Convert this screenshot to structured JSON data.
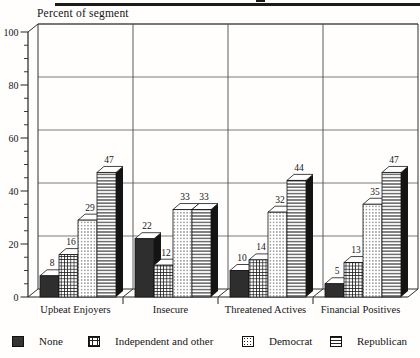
{
  "chart_data": {
    "type": "bar",
    "style": "3d-grouped",
    "title": "",
    "ylabel": "Percent of segment",
    "xlabel": "",
    "categories": [
      "Upbeat Enjoyers",
      "Insecure",
      "Threatened Actives",
      "Financial Positives"
    ],
    "series": [
      {
        "name": "None",
        "pattern": "solid-dark",
        "values": [
          8,
          22,
          10,
          5
        ]
      },
      {
        "name": "Independent and other",
        "pattern": "grid",
        "values": [
          16,
          12,
          14,
          13
        ]
      },
      {
        "name": "Democrat",
        "pattern": "dots",
        "values": [
          29,
          33,
          32,
          35
        ]
      },
      {
        "name": "Republican",
        "pattern": "hlines",
        "values": [
          47,
          33,
          44,
          47
        ]
      }
    ],
    "ylim": [
      0,
      100
    ],
    "yticks": [
      0,
      20,
      40,
      60,
      80,
      100
    ],
    "minor_tick_step": 5,
    "grid": true,
    "value_labels": true,
    "legend_position": "bottom",
    "colors": {
      "ink": "#1b1b1b",
      "grid_line": "#5a5a5a",
      "bar_side": "#141414",
      "bar_top": "#ffffff",
      "none_fill": "#2e2e2e"
    }
  },
  "legend": {
    "items": [
      {
        "label": "None",
        "pattern": "solid-dark"
      },
      {
        "label": "Independent and other",
        "pattern": "grid"
      },
      {
        "label": "Democrat",
        "pattern": "dots"
      },
      {
        "label": "Republican",
        "pattern": "hlines"
      }
    ]
  }
}
